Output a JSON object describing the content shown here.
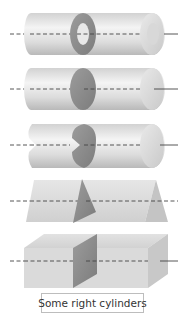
{
  "figure": {
    "caption": "Some right cylinders",
    "shapes": [
      {
        "name": "hollow-circular-cylinder",
        "cross_section": "annulus"
      },
      {
        "name": "solid-circular-cylinder",
        "cross_section": "disk"
      },
      {
        "name": "lobed-cylinder",
        "cross_section": "heart-shaped region"
      },
      {
        "name": "triangular-prism",
        "cross_section": "triangle"
      },
      {
        "name": "rectangular-prism",
        "cross_section": "rectangle"
      }
    ],
    "colors": {
      "body_light": "#f2f2f2",
      "body_mid": "#d4d4d4",
      "body_dark": "#b8b8b8",
      "section": "#8f8f8f",
      "axis": "#444444",
      "caption_border": "#bdbdbd"
    }
  }
}
